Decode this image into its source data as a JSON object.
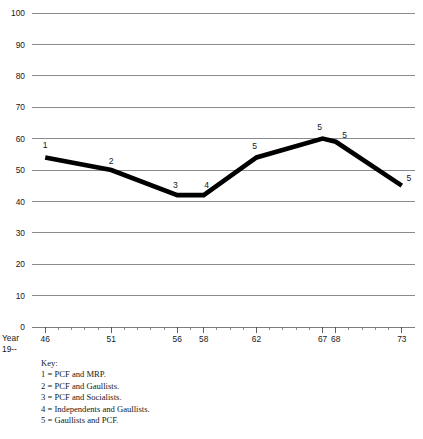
{
  "chart_data": {
    "type": "line",
    "title": "",
    "xlabel": "Year 19--",
    "ylabel": "",
    "x": [
      46,
      51,
      56,
      58,
      62,
      67,
      68,
      73
    ],
    "values": [
      54,
      50,
      42,
      42,
      54,
      60,
      59,
      45
    ],
    "point_labels": [
      "1",
      "2",
      "3",
      "4",
      "5",
      "5",
      "5",
      "5"
    ],
    "xlim": [
      45,
      74
    ],
    "ylim": [
      0,
      100
    ],
    "ytick_values": [
      0,
      10,
      20,
      30,
      40,
      50,
      60,
      70,
      80,
      90,
      100
    ],
    "ytick_labels": [
      "0",
      "10",
      "20",
      "30",
      "40",
      "50",
      "60",
      "70",
      "80",
      "90",
      "100"
    ],
    "xtick_labels": [
      "46",
      "51",
      "56",
      "58",
      "62",
      "67",
      "68",
      "73"
    ],
    "grid": true,
    "legend_position": "below-plot",
    "line_color": "#000000",
    "grid_color": "#6c6f73"
  },
  "axis": {
    "x_caption_line1": "Year",
    "x_caption_line2": "19--"
  },
  "key": {
    "heading": "Key:",
    "entries": [
      "1 = PCF and MRP.",
      "2 = PCF and Gaullists.",
      "3 = PCF and Socialists.",
      "4 = Independents and Gaullists.",
      "5 = Gaullists and PCF."
    ]
  }
}
